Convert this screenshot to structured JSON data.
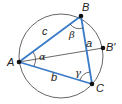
{
  "diagram": {
    "colors": {
      "sides": "#3a7bc8",
      "circle": "#555555",
      "points": "#111111",
      "text": "#222222"
    },
    "vertices": [
      {
        "id": "A",
        "label": "A",
        "x": 19,
        "y": 62
      },
      {
        "id": "B",
        "label": "B",
        "x": 81,
        "y": 16
      },
      {
        "id": "C",
        "label": "C",
        "x": 92,
        "y": 84
      },
      {
        "id": "B'",
        "label": "B'",
        "x": 103,
        "y": 48
      }
    ],
    "sides": [
      {
        "label": "a",
        "from": "B",
        "to": "C"
      },
      {
        "label": "b",
        "from": "A",
        "to": "C"
      },
      {
        "label": "c",
        "from": "A",
        "to": "B"
      }
    ],
    "angles": [
      {
        "label": "α",
        "vertex": "A"
      },
      {
        "label": "β",
        "vertex": "B"
      },
      {
        "label": "γ",
        "vertex": "C"
      }
    ],
    "circle": {
      "cx": 61,
      "cy": 56,
      "r": 42
    },
    "extra_segment": {
      "from": "A",
      "to": "B'"
    }
  }
}
